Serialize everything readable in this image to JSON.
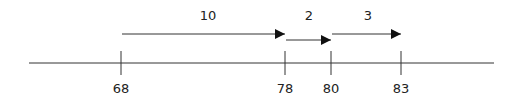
{
  "diagram": {
    "type": "number-line",
    "colors": {
      "line": "#333333",
      "text": "#222222",
      "background": "#ffffff"
    },
    "axis": {
      "x_start": 29,
      "x_end": 494,
      "y": 63
    },
    "ticks": [
      {
        "value": "68",
        "x": 121
      },
      {
        "value": "78",
        "x": 285
      },
      {
        "value": "80",
        "x": 331
      },
      {
        "value": "83",
        "x": 401
      }
    ],
    "jumps": [
      {
        "label": "10",
        "from": "68",
        "to": "78",
        "x1": 121,
        "x2": 285,
        "y": 34
      },
      {
        "label": "2",
        "from": "78",
        "to": "80",
        "x1": 285,
        "x2": 331,
        "y": 40
      },
      {
        "label": "3",
        "from": "80",
        "to": "83",
        "x1": 331,
        "x2": 401,
        "y": 34
      }
    ]
  }
}
